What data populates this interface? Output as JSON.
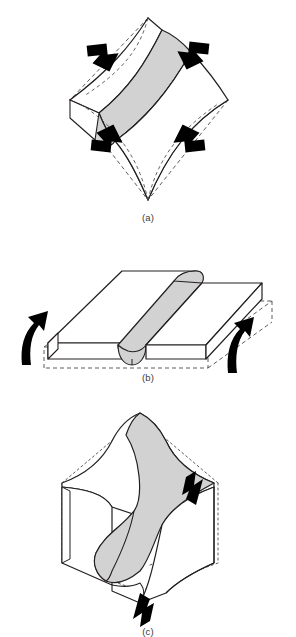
{
  "figure": {
    "background_color": "#ffffff",
    "line_color": "#231f20",
    "layer_fill_color": "#d2d2d2",
    "block_fill_color": "#ffffff",
    "arrow_color": "#000000",
    "dashed_color": "#4a4a4a"
  },
  "panels": [
    {
      "id": "a",
      "caption": "(a)",
      "mechanism": "buckling",
      "block_shape": "cuboid with four inward-bowed faces, diamond orientation",
      "fold_form": "upright antiform, single competent layer arched into a cylindrical hinge",
      "layer_label": "competent shaded layer",
      "undeformed_outline": "dashed straight edges of original cube",
      "arrows": [
        {
          "name": "compression-arrow-top-left",
          "direction": "down-right",
          "type": "straight-block-arrow"
        },
        {
          "name": "compression-arrow-top-right",
          "direction": "down-left",
          "type": "straight-block-arrow"
        },
        {
          "name": "compression-arrow-bottom-left",
          "direction": "up-right",
          "type": "straight-block-arrow"
        },
        {
          "name": "compression-arrow-bottom-right",
          "direction": "up-left",
          "type": "straight-block-arrow"
        }
      ]
    },
    {
      "id": "b",
      "caption": "(b)",
      "mechanism": "bending",
      "block_shape": "tabular slab kinked upward about a central hinge line",
      "fold_form": "chevron / kink antiform with angular hinge",
      "layer_label": "competent shaded layer",
      "undeformed_outline": "dashed rectangular prism of the original slab",
      "arrows": [
        {
          "name": "uplift-arrow-left",
          "direction": "curved-up",
          "type": "curved-block-arrow"
        },
        {
          "name": "uplift-arrow-right",
          "direction": "curved-up",
          "type": "curved-block-arrow"
        }
      ]
    },
    {
      "id": "c",
      "caption": "(c)",
      "mechanism": "shear",
      "block_shape": "cuboid with S-shaped sinusoidal profile on front and top faces",
      "fold_form": "asymmetric S-fold produced by a shear couple",
      "layer_label": "competent shaded layer",
      "undeformed_outline": "dotted original block edges",
      "arrows": [
        {
          "name": "shear-arrow-right-down",
          "direction": "down",
          "type": "straight-block-arrow"
        },
        {
          "name": "shear-arrow-bottom-up",
          "direction": "up",
          "type": "straight-block-arrow"
        }
      ]
    }
  ],
  "captions": {
    "a": "(a)",
    "b": "(b)",
    "c": "(c)"
  }
}
